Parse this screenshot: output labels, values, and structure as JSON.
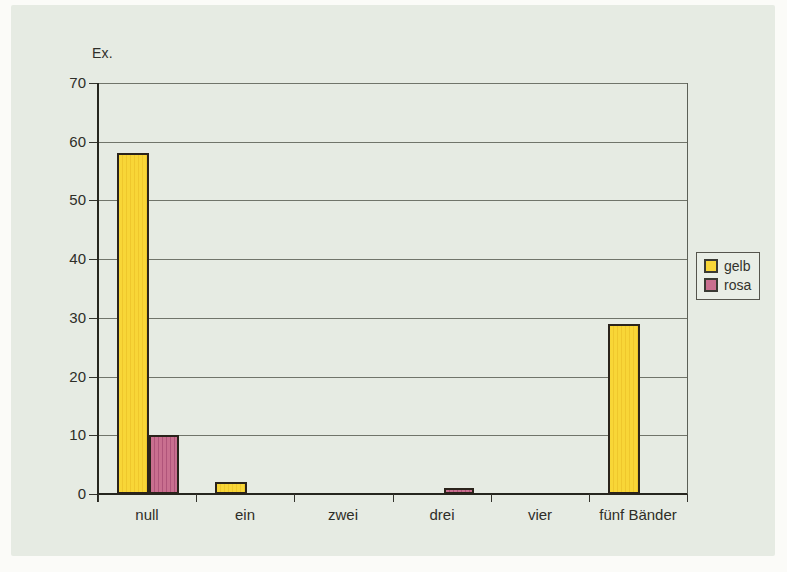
{
  "page": {
    "panel_background": "#e6ebe3",
    "outer_background": "#fbfbf8"
  },
  "chart_data": {
    "type": "bar",
    "title": "",
    "ylabel": "Ex.",
    "xlabel": "",
    "categories": [
      "null",
      "ein",
      "zwei",
      "drei",
      "vier",
      "fünf Bänder"
    ],
    "series": [
      {
        "name": "gelb",
        "color": "#f8d637",
        "stripe": "#efc72c",
        "values": [
          58,
          2,
          0,
          0,
          0,
          29
        ]
      },
      {
        "name": "rosa",
        "color": "#c96f8f",
        "stripe": "#b0547a",
        "values": [
          10,
          0,
          0,
          1,
          0,
          0
        ]
      }
    ],
    "ylim": [
      0,
      70
    ],
    "ytick_step": 10,
    "yticks": [
      0,
      10,
      20,
      30,
      40,
      50,
      60,
      70
    ],
    "grid": true,
    "legend_position": "right",
    "legend_entries": [
      "gelb",
      "rosa"
    ]
  }
}
